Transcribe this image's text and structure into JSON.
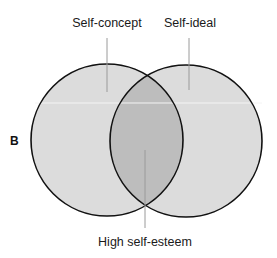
{
  "diagram": {
    "panel_label": "B",
    "labels": {
      "left_circle": "Self-concept",
      "right_circle": "Self-ideal",
      "overlap": "High self-esteem"
    },
    "colors": {
      "circle_fill": "#dcdcdc",
      "overlap_fill": "#bdbdbd",
      "stroke": "#111111",
      "leader_line": "#9a9a9a",
      "background": "#ffffff"
    }
  }
}
